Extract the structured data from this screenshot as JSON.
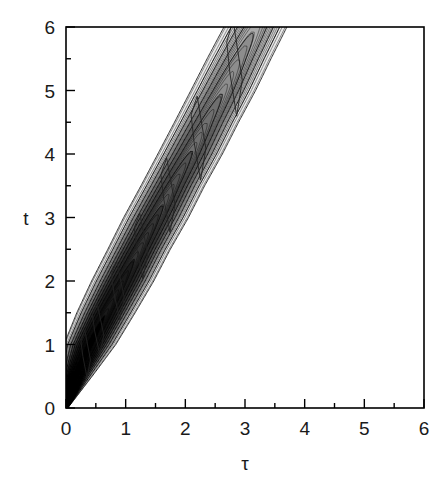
{
  "figure": {
    "background_color": "#ffffff",
    "frame_color": "#000000",
    "width": 448,
    "height": 489
  },
  "chart_data": {
    "type": "heatmap",
    "render_style": "filled-contour",
    "title": "",
    "xlabel": "τ",
    "ylabel": "t",
    "xlim": [
      0,
      6
    ],
    "ylim": [
      0,
      6
    ],
    "grid": false,
    "legend": null,
    "colorbar": false,
    "colormap": "grayscale-inverted",
    "x_major_ticks": [
      0,
      1,
      2,
      3,
      4,
      5,
      6
    ],
    "x_minor_ticks": [
      0.5,
      1.5,
      2.5,
      3.5,
      4.5,
      5.5
    ],
    "y_major_ticks": [
      0,
      1,
      2,
      3,
      4,
      5,
      6
    ],
    "y_minor_ticks": [
      0.5,
      1.5,
      2.5,
      3.5,
      4.5,
      5.5
    ],
    "x_tick_labels": [
      "0",
      "1",
      "2",
      "3",
      "4",
      "5",
      "6"
    ],
    "y_tick_labels": [
      "0",
      "1",
      "2",
      "3",
      "4",
      "5",
      "6"
    ],
    "tick_direction": "in",
    "ridge": {
      "origin": [
        0,
        0
      ],
      "slope_t_per_tau": 2.0,
      "exit_top_tau_range": [
        2.55,
        3.35
      ]
    },
    "contour_levels": [
      {
        "level": 1,
        "gray": "#e8e8e8"
      },
      {
        "level": 2,
        "gray": "#d6d6d6"
      },
      {
        "level": 3,
        "gray": "#c8c8c8"
      },
      {
        "level": 4,
        "gray": "#ababab"
      },
      {
        "level": 5,
        "gray": "#8d8d8d"
      },
      {
        "level": 6,
        "gray": "#6f6f6f"
      },
      {
        "level": 7,
        "gray": "#515151"
      },
      {
        "level": 8,
        "gray": "#343434"
      },
      {
        "level": 9,
        "gray": "#1a1a1a"
      },
      {
        "level": 10,
        "gray": "#000000"
      }
    ],
    "band_samples": [
      {
        "t": 0.0,
        "tau_left": 0.0,
        "tau_right": 0.02,
        "intensity": 1.0
      },
      {
        "t": 0.5,
        "tau_left": 0.02,
        "tau_right": 0.3,
        "intensity": 0.98
      },
      {
        "t": 1.0,
        "tau_left": 0.18,
        "tau_right": 0.62,
        "intensity": 0.9
      },
      {
        "t": 1.5,
        "tau_left": 0.42,
        "tau_right": 0.92,
        "intensity": 0.8
      },
      {
        "t": 2.0,
        "tau_left": 0.68,
        "tau_right": 1.22,
        "intensity": 0.7
      },
      {
        "t": 2.5,
        "tau_left": 0.95,
        "tau_right": 1.5,
        "intensity": 0.61
      },
      {
        "t": 3.0,
        "tau_left": 1.22,
        "tau_right": 1.8,
        "intensity": 0.52
      },
      {
        "t": 3.5,
        "tau_left": 1.5,
        "tau_right": 2.08,
        "intensity": 0.44
      },
      {
        "t": 4.0,
        "tau_left": 1.78,
        "tau_right": 2.38,
        "intensity": 0.37
      },
      {
        "t": 4.5,
        "tau_left": 2.05,
        "tau_right": 2.66,
        "intensity": 0.3
      },
      {
        "t": 5.0,
        "tau_left": 2.32,
        "tau_right": 2.95,
        "intensity": 0.25
      },
      {
        "t": 5.5,
        "tau_left": 2.58,
        "tau_right": 3.22,
        "intensity": 0.2
      },
      {
        "t": 6.0,
        "tau_left": 2.85,
        "tau_right": 3.5,
        "intensity": 0.16
      }
    ]
  }
}
